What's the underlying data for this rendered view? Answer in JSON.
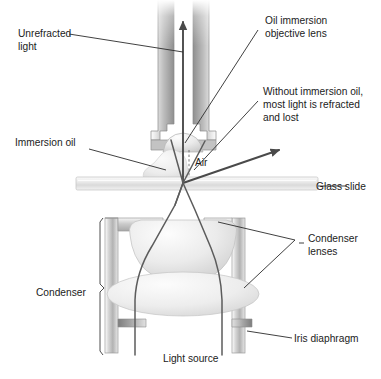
{
  "figure": {
    "type": "labeled-diagram"
  },
  "labels": {
    "unrefracted_light_line1": "Unrefracted",
    "unrefracted_light_line2": "light",
    "immersion_oil": "Immersion oil",
    "objective_lens_line1": "Oil immersion",
    "objective_lens_line2": "objective lens",
    "without_oil_line1": "Without immersion oil,",
    "without_oil_line2": "most light is refracted",
    "without_oil_line3": "and lost",
    "air": "Air",
    "glass_slide": "Glass slide",
    "condenser_lenses_line1": "Condenser",
    "condenser_lenses_line2": "lenses",
    "condenser": "Condenser",
    "iris_diaphragm": "Iris diaphragm",
    "light_source": "Light source"
  },
  "colors": {
    "background": "#ffffff",
    "text": "#1b1b1b",
    "leader_line": "#2b2b2b",
    "ray": "#4a4a4a",
    "metal_light": "#f2f2f2",
    "metal_mid": "#c9c9c9",
    "metal_dark": "#9a9a9a",
    "glass_light": "#fbfbfb",
    "glass_mid": "#e2e2e2",
    "glass_shade": "#cfcfcf",
    "oil": "#ededed"
  },
  "components": [
    {
      "id": "objective-lens",
      "name": "Oil immersion objective lens"
    },
    {
      "id": "immersion-oil",
      "name": "Immersion oil droplet"
    },
    {
      "id": "air-gap",
      "name": "Air gap"
    },
    {
      "id": "glass-slide",
      "name": "Glass slide"
    },
    {
      "id": "condenser-upper-lens",
      "name": "Upper condenser lens"
    },
    {
      "id": "condenser-lower-lens",
      "name": "Lower condenser lens"
    },
    {
      "id": "condenser-housing",
      "name": "Condenser housing"
    },
    {
      "id": "iris-diaphragm",
      "name": "Iris diaphragm"
    },
    {
      "id": "light-source",
      "name": "Light source rays"
    }
  ],
  "rays": [
    {
      "id": "unrefracted-ray",
      "description": "Vertical ray passing up through oil into objective"
    },
    {
      "id": "refracted-lost-ray",
      "description": "Ray refracted away at air interface and lost"
    },
    {
      "id": "condenser-ray-left",
      "description": "Left illumination ray through condenser"
    },
    {
      "id": "condenser-ray-right",
      "description": "Right illumination ray through condenser"
    }
  ]
}
